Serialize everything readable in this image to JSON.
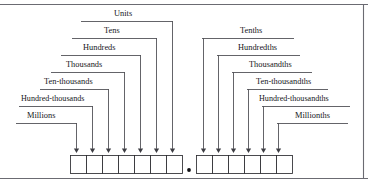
{
  "diagram": {
    "decimal_point": "•",
    "colors": {
      "line": "#3c3c42",
      "box_stroke": "#2b2b30",
      "frame": "#6b6b72",
      "text": "#16161a",
      "background": "#ffffff"
    },
    "whole_part": {
      "name": "whole-number-places",
      "cell_count": 7,
      "labels": [
        {
          "id": "units",
          "text": "Units",
          "label_x": 114,
          "label_y": 16,
          "line_y": 21,
          "line_x1": 81,
          "line_x2": 173,
          "drop_x": 172,
          "arrow_x": 172
        },
        {
          "id": "tens",
          "text": "Tens",
          "label_x": 104,
          "label_y": 33,
          "line_y": 38,
          "line_x1": 72,
          "line_x2": 157,
          "drop_x": 156,
          "arrow_x": 156
        },
        {
          "id": "hundreds",
          "text": "Hundreds",
          "label_x": 83,
          "label_y": 50,
          "line_y": 55,
          "line_x1": 61,
          "line_x2": 141,
          "drop_x": 140,
          "arrow_x": 140
        },
        {
          "id": "thousands",
          "text": "Thousands",
          "label_x": 66,
          "label_y": 67,
          "line_y": 72,
          "line_x1": 51,
          "line_x2": 125,
          "drop_x": 124,
          "arrow_x": 124
        },
        {
          "id": "ten-thousands",
          "text": "Ten-thousands",
          "label_x": 44,
          "label_y": 84,
          "line_y": 89,
          "line_x1": 40,
          "line_x2": 109,
          "drop_x": 108,
          "arrow_x": 108
        },
        {
          "id": "hundred-thousands",
          "text": "Hundred-thousands",
          "label_x": 21,
          "label_y": 101,
          "line_y": 106,
          "line_x1": 19,
          "line_x2": 93,
          "drop_x": 92,
          "arrow_x": 92
        },
        {
          "id": "millions",
          "text": "Millions",
          "label_x": 27,
          "label_y": 118,
          "line_y": 123,
          "line_x1": 16,
          "line_x2": 77,
          "drop_x": 76,
          "arrow_x": 76
        }
      ],
      "cells": [
        {
          "index": 0,
          "x": 70,
          "width": 16
        },
        {
          "index": 1,
          "x": 86,
          "width": 16
        },
        {
          "index": 2,
          "x": 102,
          "width": 16
        },
        {
          "index": 3,
          "x": 118,
          "width": 16
        },
        {
          "index": 4,
          "x": 134,
          "width": 16
        },
        {
          "index": 5,
          "x": 150,
          "width": 16
        },
        {
          "index": 6,
          "x": 166,
          "width": 16
        }
      ]
    },
    "fraction_part": {
      "name": "decimal-places",
      "cell_count": 6,
      "labels": [
        {
          "id": "tenths",
          "text": "Tenths",
          "label_x": 240,
          "label_y": 33,
          "line_y": 38,
          "line_x1": 202,
          "line_x2": 294,
          "drop_x": 203,
          "arrow_x": 203
        },
        {
          "id": "hundredths",
          "text": "Hundredths",
          "label_x": 238,
          "label_y": 50,
          "line_y": 55,
          "line_x1": 217,
          "line_x2": 300,
          "drop_x": 218,
          "arrow_x": 218
        },
        {
          "id": "thousandths",
          "text": "Thousandths",
          "label_x": 249,
          "label_y": 67,
          "line_y": 72,
          "line_x1": 232,
          "line_x2": 312,
          "drop_x": 233,
          "arrow_x": 233
        },
        {
          "id": "ten-thousandths",
          "text": "Ten-thousandths",
          "label_x": 256,
          "label_y": 84,
          "line_y": 89,
          "line_x1": 247,
          "line_x2": 328,
          "drop_x": 248,
          "arrow_x": 248
        },
        {
          "id": "hundred-thousandths",
          "text": "Hundred-thousandths",
          "label_x": 259,
          "label_y": 101,
          "line_y": 106,
          "line_x1": 262,
          "line_x2": 350,
          "drop_x": 263,
          "arrow_x": 263
        },
        {
          "id": "millionths",
          "text": "Millionths",
          "label_x": 295,
          "label_y": 118,
          "line_y": 123,
          "line_x1": 277,
          "line_x2": 348,
          "drop_x": 278,
          "arrow_x": 278
        }
      ],
      "cells": [
        {
          "index": 0,
          "x": 196,
          "width": 16
        },
        {
          "index": 1,
          "x": 212,
          "width": 16
        },
        {
          "index": 2,
          "x": 228,
          "width": 16
        },
        {
          "index": 3,
          "x": 244,
          "width": 16
        },
        {
          "index": 4,
          "x": 260,
          "width": 16
        },
        {
          "index": 5,
          "x": 276,
          "width": 16
        }
      ]
    },
    "geometry": {
      "box_top": 155,
      "box_height": 18,
      "arrow_tip_y": 153,
      "decimal_x": 189,
      "decimal_y": 170,
      "frame_top_y": 4,
      "frame_bottom_y": 179,
      "frame_right_x": 363
    }
  }
}
